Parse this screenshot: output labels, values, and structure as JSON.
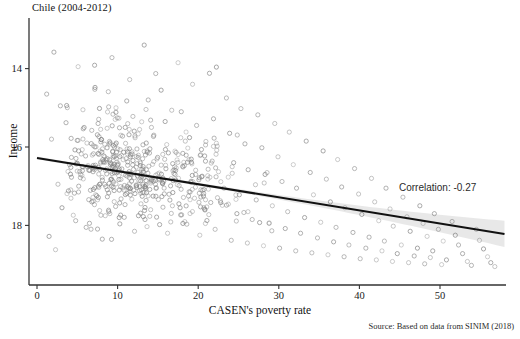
{
  "chart_data": {
    "type": "scatter",
    "title": "Chile (2004-2012)",
    "xlabel": "CASEN's poverty rate",
    "ylabel": "Income",
    "xlim": [
      -1.5,
      58.5
    ],
    "ylim": [
      12.85,
      19.1
    ],
    "xticks": [
      0,
      10,
      20,
      30,
      40,
      50
    ],
    "yticks": [
      14,
      16,
      18
    ],
    "grid": false,
    "legend": null,
    "annotations": [
      {
        "text": "Correlation: -0.27",
        "x": 46.5,
        "y": 15.35
      }
    ],
    "source_note": "Source: Based on data from SINIM (2018)",
    "trendline": {
      "type": "linear",
      "x_start": 0,
      "x_end": 58,
      "y_start": 15.72,
      "y_end": 13.78,
      "slope": -0.0334,
      "intercept": 15.72,
      "color": "#111111",
      "confidence_band": true,
      "band_color": "#d6d6d6"
    },
    "marker": {
      "shape": "open-circle",
      "size": 4.2,
      "stroke": "#808080",
      "fill": "none",
      "opacity": 0.6
    },
    "n_points": 640,
    "points": [
      [
        1.2,
        17.35
      ],
      [
        2.1,
        18.42
      ],
      [
        1.8,
        16.2
      ],
      [
        2.6,
        15.05
      ],
      [
        3.1,
        14.45
      ],
      [
        1.5,
        13.72
      ],
      [
        2.9,
        17.05
      ],
      [
        3.6,
        16.62
      ],
      [
        4.2,
        15.48
      ],
      [
        3.9,
        14.88
      ],
      [
        4.8,
        14.12
      ],
      [
        2.3,
        13.38
      ],
      [
        5.1,
        18.05
      ],
      [
        5.7,
        16.95
      ],
      [
        6.2,
        16.1
      ],
      [
        5.4,
        15.3
      ],
      [
        6.8,
        14.6
      ],
      [
        6.1,
        13.95
      ],
      [
        7.2,
        17.52
      ],
      [
        7.9,
        16.45
      ],
      [
        8.4,
        15.75
      ],
      [
        7.6,
        15.0
      ],
      [
        8.9,
        14.35
      ],
      [
        8.1,
        13.65
      ],
      [
        9.3,
        18.28
      ],
      [
        9.8,
        17.0
      ],
      [
        10.4,
        16.3
      ],
      [
        9.1,
        15.55
      ],
      [
        10.8,
        14.9
      ],
      [
        10.2,
        14.2
      ],
      [
        11.5,
        17.72
      ],
      [
        11.9,
        16.78
      ],
      [
        12.4,
        15.95
      ],
      [
        11.2,
        15.25
      ],
      [
        12.9,
        14.55
      ],
      [
        12.1,
        13.85
      ],
      [
        13.3,
        18.6
      ],
      [
        13.8,
        17.2
      ],
      [
        14.2,
        16.5
      ],
      [
        13.1,
        15.7
      ],
      [
        14.7,
        15.05
      ],
      [
        14.1,
        14.4
      ],
      [
        15.4,
        17.45
      ],
      [
        15.9,
        16.65
      ],
      [
        16.3,
        15.85
      ],
      [
        15.1,
        15.2
      ],
      [
        16.8,
        14.5
      ],
      [
        16.2,
        13.8
      ],
      [
        17.5,
        18.15
      ],
      [
        17.9,
        16.9
      ],
      [
        18.4,
        16.15
      ],
      [
        17.2,
        15.4
      ],
      [
        18.8,
        14.75
      ],
      [
        18.1,
        14.05
      ],
      [
        19.3,
        17.6
      ],
      [
        19.8,
        16.55
      ],
      [
        20.3,
        15.8
      ],
      [
        19.1,
        15.1
      ],
      [
        20.7,
        14.45
      ],
      [
        20.2,
        13.75
      ],
      [
        21.4,
        17.88
      ],
      [
        21.9,
        16.72
      ],
      [
        22.3,
        15.92
      ],
      [
        21.2,
        15.18
      ],
      [
        22.8,
        14.58
      ],
      [
        22.1,
        13.9
      ],
      [
        23.5,
        17.25
      ],
      [
        23.9,
        16.35
      ],
      [
        24.4,
        15.6
      ],
      [
        23.2,
        14.95
      ],
      [
        24.8,
        14.3
      ],
      [
        24.1,
        13.62
      ],
      [
        25.3,
        16.98
      ],
      [
        25.8,
        16.08
      ],
      [
        26.2,
        15.42
      ],
      [
        25.1,
        14.78
      ],
      [
        26.7,
        14.15
      ],
      [
        26.1,
        13.55
      ],
      [
        27.4,
        16.82
      ],
      [
        27.9,
        15.98
      ],
      [
        28.3,
        15.3
      ],
      [
        27.2,
        14.65
      ],
      [
        28.8,
        14.05
      ],
      [
        28.1,
        13.48
      ],
      [
        29.5,
        16.6
      ],
      [
        29.9,
        15.75
      ],
      [
        30.4,
        15.12
      ],
      [
        29.2,
        14.5
      ],
      [
        30.8,
        13.92
      ],
      [
        30.1,
        13.42
      ],
      [
        31.3,
        16.38
      ],
      [
        31.8,
        15.55
      ],
      [
        32.2,
        14.95
      ],
      [
        31.1,
        14.35
      ],
      [
        32.7,
        13.8
      ],
      [
        32.1,
        13.35
      ],
      [
        33.4,
        16.15
      ],
      [
        33.9,
        15.35
      ],
      [
        34.3,
        14.78
      ],
      [
        33.2,
        14.2
      ],
      [
        34.8,
        13.68
      ],
      [
        34.1,
        13.3
      ],
      [
        35.5,
        15.9
      ],
      [
        35.9,
        15.18
      ],
      [
        36.4,
        14.6
      ],
      [
        35.2,
        14.08
      ],
      [
        36.8,
        13.58
      ],
      [
        36.1,
        13.25
      ],
      [
        37.3,
        15.68
      ],
      [
        37.8,
        14.98
      ],
      [
        38.2,
        14.45
      ],
      [
        37.1,
        13.95
      ],
      [
        38.7,
        13.5
      ],
      [
        38.1,
        13.2
      ],
      [
        39.4,
        15.45
      ],
      [
        39.9,
        14.8
      ],
      [
        40.3,
        14.28
      ],
      [
        39.2,
        13.82
      ],
      [
        40.8,
        13.42
      ],
      [
        40.1,
        13.15
      ],
      [
        41.5,
        15.2
      ],
      [
        41.9,
        14.6
      ],
      [
        42.4,
        14.12
      ],
      [
        41.2,
        13.7
      ],
      [
        42.8,
        13.35
      ],
      [
        42.1,
        13.12
      ],
      [
        43.3,
        14.95
      ],
      [
        43.8,
        14.42
      ],
      [
        44.2,
        13.98
      ],
      [
        43.1,
        13.6
      ],
      [
        44.7,
        13.28
      ],
      [
        44.1,
        13.08
      ],
      [
        45.4,
        14.72
      ],
      [
        45.9,
        14.22
      ],
      [
        46.3,
        13.85
      ],
      [
        45.2,
        13.5
      ],
      [
        46.8,
        13.22
      ],
      [
        46.1,
        13.05
      ],
      [
        47.5,
        14.5
      ],
      [
        47.9,
        14.05
      ],
      [
        48.4,
        13.72
      ],
      [
        47.2,
        13.42
      ],
      [
        48.8,
        13.18
      ],
      [
        48.1,
        13.02
      ],
      [
        49.3,
        14.3
      ],
      [
        49.8,
        13.9
      ],
      [
        50.4,
        13.6
      ],
      [
        49.1,
        13.35
      ],
      [
        50.8,
        13.12
      ],
      [
        50.2,
        13.0
      ],
      [
        51.5,
        14.1
      ],
      [
        51.9,
        13.75
      ],
      [
        52.3,
        13.5
      ],
      [
        52.8,
        13.28
      ],
      [
        53.4,
        13.08
      ],
      [
        53.9,
        12.98
      ],
      [
        54.5,
        13.9
      ],
      [
        54.9,
        13.62
      ],
      [
        55.4,
        13.4
      ],
      [
        55.9,
        13.2
      ],
      [
        56.3,
        13.05
      ],
      [
        56.8,
        12.95
      ]
    ]
  },
  "axis": {
    "y_tick_labels": [
      "18",
      "16",
      "14"
    ],
    "x_tick_labels": [
      "0",
      "10",
      "20",
      "30",
      "40",
      "50"
    ]
  }
}
